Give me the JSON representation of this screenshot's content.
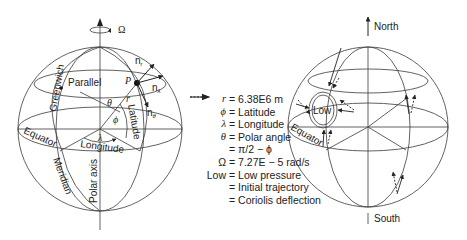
{
  "left_globe": {
    "rotation_symbol": "Ω",
    "labels": {
      "greenwich": "Greenwich",
      "parallel": "Parallel",
      "point": "P",
      "n_r": "n",
      "n_r_sub": "r",
      "n_lambda": "n",
      "n_lambda_sub": "λ",
      "n_theta": "n",
      "n_theta_sub": "θ",
      "theta": "θ",
      "phi": "ϕ",
      "r": "r",
      "latitude": "Latitude",
      "lambda": "λ",
      "longitude": "Longitude",
      "equator": "Equator",
      "meridian": "Meridian",
      "polar_axis": "Polar axis"
    }
  },
  "legend": {
    "rows": [
      {
        "symbol": "r",
        "text": "= 6.38E6 m"
      },
      {
        "symbol": "ϕ",
        "text": "= Latitude"
      },
      {
        "symbol": "λ",
        "text": "= Longitude"
      },
      {
        "symbol": "θ",
        "text": "= Polar angle"
      },
      {
        "symbol": "",
        "text": "= π/2 − ϕ"
      },
      {
        "symbol": "Ω",
        "text": "= 7.27E − 5 rad/s"
      },
      {
        "symbol": "Low",
        "text": "= Low pressure"
      },
      {
        "symbol": "solid-arrow",
        "text": "= Initial trajectory"
      },
      {
        "symbol": "dotted-arrow",
        "text": "= Coriolis deflection"
      }
    ]
  },
  "right_globe": {
    "labels": {
      "north": "North",
      "south": "South",
      "low": "Low",
      "equator": "Equator"
    }
  }
}
